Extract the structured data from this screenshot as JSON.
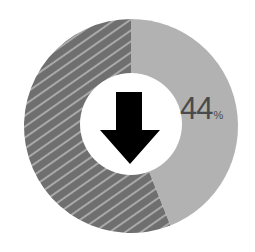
{
  "chart_data": {
    "type": "pie",
    "variant": "donut",
    "title": "",
    "slices": [
      {
        "label": "highlighted",
        "value": 44,
        "color": "#b2b2b2",
        "pattern": "solid"
      },
      {
        "label": "remainder",
        "value": 56,
        "color": "#6f6f6f",
        "pattern": "diagonal-hatch",
        "stripe_color": "#a9a9a9"
      }
    ],
    "center_icon": "down-arrow-icon",
    "annotation": {
      "value": "44",
      "unit": "%"
    },
    "legend": null
  },
  "label": {
    "value": "44",
    "unit": "%"
  },
  "colors": {
    "light_slice": "#b2b2b2",
    "dark_slice": "#6f6f6f",
    "hatch_stripe": "#a9a9a9",
    "center_fill": "#ffffff",
    "arrow": "#000000",
    "label_text": "#4a4a4a"
  }
}
